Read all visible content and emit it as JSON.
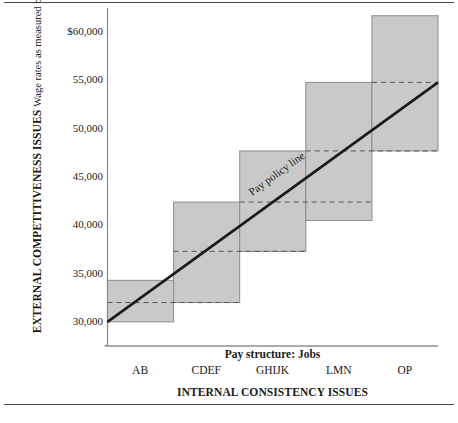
{
  "figure": {
    "top_rule": "",
    "bottom_rule": ""
  },
  "chart_data": {
    "type": "bar",
    "title": "",
    "subtitle": "",
    "xlabel": "INTERNAL CONSISTENCY ISSUES",
    "xlabel_secondary": "Pay structure: Jobs",
    "ylabel": "EXTERNAL COMPETITIVENESS ISSUES",
    "ylabel_secondary": "Wage rates as measured by survey",
    "categories": [
      "AB",
      "CDEF",
      "GHIJK",
      "LMN",
      "OP"
    ],
    "ylim": [
      27500,
      62500
    ],
    "yticks": [
      30000,
      35000,
      40000,
      45000,
      50000,
      55000,
      60000
    ],
    "ytick_labels": [
      "30,000",
      "35,000",
      "40,000",
      "45,000",
      "50,000",
      "55,000",
      "$60,000"
    ],
    "grid": false,
    "legend": null,
    "series": [
      {
        "name": "Pay range (grade band)",
        "kind": "range-box",
        "ranges": [
          {
            "category": "AB",
            "min": 30000,
            "max": 34300,
            "midpoint": 32000
          },
          {
            "category": "CDEF",
            "min": 32000,
            "max": 42400,
            "midpoint": 37300
          },
          {
            "category": "GHIJK",
            "min": 37300,
            "max": 47700,
            "midpoint": 42400
          },
          {
            "category": "LMN",
            "min": 40500,
            "max": 54800,
            "midpoint": 47700
          },
          {
            "category": "OP",
            "min": 47700,
            "max": 61700,
            "midpoint": 54800
          }
        ]
      },
      {
        "name": "Pay policy line",
        "kind": "line",
        "annotation": "Pay policy line",
        "x_start": "AB",
        "x_end": "OP",
        "y_start": 30000,
        "y_end": 54800
      }
    ],
    "colors": {
      "box_fill": "#c9c9c9",
      "box_stroke": "#8c8c8c",
      "policy_line": "#1a1a1a",
      "midpoint_line": "#555555",
      "axis": "#8c8c8c",
      "text": "#1a1a1a"
    }
  }
}
